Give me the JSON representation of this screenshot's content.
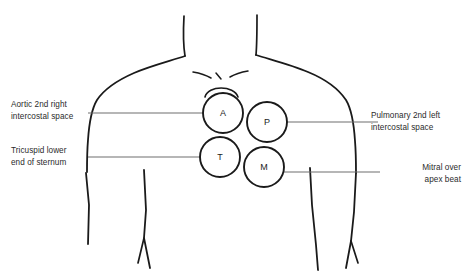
{
  "diagram": {
    "background_color": "#ffffff",
    "outline_color": "#1a1a1a",
    "leader_color": "#6e6e6e",
    "text_color": "#2b2b2b"
  },
  "points": [
    {
      "id": "aortic",
      "letter": "A",
      "cx": 223,
      "cy": 113,
      "r": 20
    },
    {
      "id": "pulmonary",
      "letter": "P",
      "cx": 267,
      "cy": 122,
      "r": 20
    },
    {
      "id": "tricuspid",
      "letter": "T",
      "cx": 220,
      "cy": 157,
      "r": 20
    },
    {
      "id": "mitral",
      "letter": "M",
      "cx": 264,
      "cy": 167,
      "r": 20
    }
  ],
  "labels": {
    "aortic": {
      "line1": "Aortic 2nd right",
      "line2": "intercostal space"
    },
    "tricuspid": {
      "line1": "Tricuspid lower",
      "line2": "end of sternum"
    },
    "pulmonary": {
      "line1": "Pulmonary 2nd left",
      "line2": "intercostal space"
    },
    "mitral": {
      "line1": "Mitral over",
      "line2": "apex beat"
    }
  },
  "leaders": [
    {
      "id": "aortic-leader",
      "x1": 88,
      "y1": 113,
      "x2": 203,
      "y2": 113
    },
    {
      "id": "tricuspid-leader",
      "x1": 88,
      "y1": 157,
      "x2": 200,
      "y2": 157
    },
    {
      "id": "pulmonary-leader",
      "x1": 287,
      "y1": 122,
      "x2": 378,
      "y2": 122
    },
    {
      "id": "mitral-leader",
      "x1": 284,
      "y1": 172,
      "x2": 380,
      "y2": 172
    }
  ]
}
